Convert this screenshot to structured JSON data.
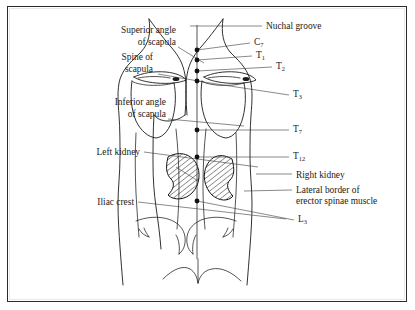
{
  "figure": {
    "view": "posterior",
    "border_color": "#2b2b2b",
    "ink_color": "#1b1b1b",
    "background": "#ffffff"
  },
  "labels_left": [
    {
      "id": "superior-angle-of-scapula",
      "line1": "Superior angle",
      "line2": "of scapula",
      "x": 168,
      "y1": 26,
      "y2": 38,
      "leader": [
        [
          170,
          40
        ],
        [
          196,
          56
        ]
      ]
    },
    {
      "id": "spine-of-scapula",
      "line1": "Spine of",
      "line2": "scapula",
      "x": 145,
      "y1": 53,
      "y2": 65,
      "leader": [
        [
          150,
          67
        ],
        [
          196,
          75
        ]
      ]
    },
    {
      "id": "inferior-angle-of-scapula",
      "line1": "Inferior angle",
      "line2": "of scapula",
      "x": 158,
      "y1": 98,
      "y2": 110,
      "leader": [
        [
          160,
          112
        ],
        [
          236,
          119
        ]
      ]
    },
    {
      "id": "left-kidney",
      "line1": "Left kidney",
      "line2": "",
      "x": 132,
      "y1": 148,
      "y2": 0,
      "leader": [
        [
          136,
          145
        ],
        [
          250,
          160
        ]
      ]
    },
    {
      "id": "iliac-crest",
      "line1": "Iliac crest",
      "line2": "",
      "x": 126,
      "y1": 198,
      "y2": 0,
      "leader": [
        [
          130,
          195
        ],
        [
          278,
          212
        ]
      ]
    }
  ],
  "labels_right": [
    {
      "id": "nuchal-groove",
      "line1": "Nuchal groove",
      "line2": "",
      "x": 258,
      "y1": 22,
      "leader": [
        [
          224,
          19
        ],
        [
          254,
          19
        ]
      ]
    },
    {
      "id": "right-kidney",
      "line1": "Right kidney",
      "line2": "",
      "x": 288,
      "y1": 171,
      "leader": [
        [
          248,
          167
        ],
        [
          284,
          167
        ]
      ]
    },
    {
      "id": "lateral-border-erector-spinae",
      "line1": "Lateral border of",
      "line2": "erector spinae muscle",
      "x": 288,
      "y1": 186,
      "y2": 197,
      "leader": [
        [
          236,
          184
        ],
        [
          284,
          183
        ]
      ]
    }
  ],
  "vertebrae": [
    {
      "id": "c7",
      "letter": "C",
      "number": "7",
      "x": 246,
      "y": 38,
      "dot": [
        189,
        43
      ],
      "leader": [
        [
          189,
          43
        ],
        [
          242,
          36
        ]
      ]
    },
    {
      "id": "t1",
      "letter": "T",
      "number": "1",
      "x": 248,
      "y": 51,
      "dot": [
        189,
        53
      ],
      "leader": [
        [
          189,
          53
        ],
        [
          244,
          49
        ]
      ]
    },
    {
      "id": "t2",
      "letter": "T",
      "number": "2",
      "x": 268,
      "y": 62,
      "dot": [
        189,
        64
      ],
      "leader": [
        [
          189,
          64
        ],
        [
          264,
          60
        ]
      ]
    },
    {
      "id": "t3",
      "letter": "T",
      "number": "3",
      "x": 285,
      "y": 90,
      "dot": [
        189,
        74
      ],
      "leader": [
        [
          189,
          74
        ],
        [
          281,
          88
        ]
      ]
    },
    {
      "id": "t7",
      "letter": "T",
      "number": "7",
      "x": 285,
      "y": 125,
      "dot": [
        189,
        123
      ],
      "leader": [
        [
          189,
          123
        ],
        [
          281,
          123
        ]
      ]
    },
    {
      "id": "t12",
      "letter": "T",
      "number": "12",
      "x": 285,
      "y": 152,
      "dot": [
        189,
        150
      ],
      "leader": [
        [
          189,
          150
        ],
        [
          281,
          150
        ]
      ]
    },
    {
      "id": "l3",
      "letter": "L",
      "number": "3",
      "x": 290,
      "y": 215,
      "dot": [
        189,
        194
      ],
      "leader": [
        [
          189,
          194
        ],
        [
          286,
          213
        ]
      ]
    }
  ],
  "organs": {
    "left_kidney": {
      "id": "left-kidney-shape",
      "hatched": true,
      "cx": 172,
      "cy": 170
    },
    "right_kidney": {
      "id": "right-kidney-shape",
      "hatched": true,
      "cx": 222,
      "cy": 172
    }
  }
}
